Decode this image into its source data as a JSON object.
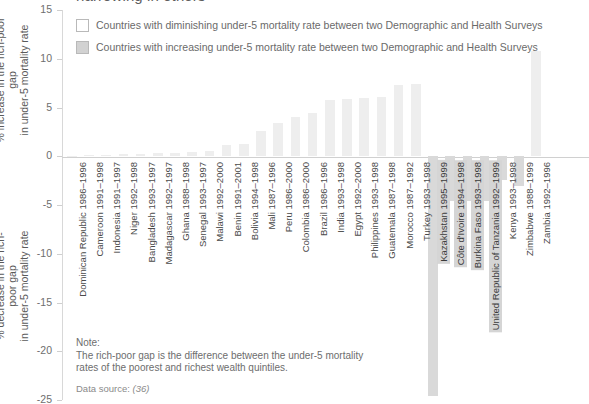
{
  "chart": {
    "title": "narrowing in others",
    "legend": [
      {
        "key": "diminishing",
        "label": "Countries with diminishing under-5 mortality rate between two Demographic and Health Surveys",
        "swatch": "#ffffff"
      },
      {
        "key": "increasing",
        "label": "Countries with increasing under-5 mortality rate between two Demographic and Health Surveys",
        "swatch": "#d2d2d2"
      }
    ],
    "axis_title_up": "% increase in the rich-poor gap\nin under-5 mortality rate",
    "axis_title_down": "% decrease in the rich-poor gap\nin under-5 mortality rate",
    "note_heading": "Note:",
    "note_body": "The rich-poor gap is the difference between the under-5 mortality\nrates of the poorest and richest wealth quintiles.",
    "source_prefix": "Data source: ",
    "source_ref": "(36)"
  },
  "chart_data": {
    "type": "bar",
    "title": "narrowing in others",
    "xlabel": "",
    "ylabel": "% increase / % decrease in the rich-poor gap in under-5 mortality rate",
    "ylim": [
      -25,
      15
    ],
    "yticks": [
      15,
      10,
      5,
      0,
      -5,
      -10,
      -15,
      -20,
      -25
    ],
    "grid": false,
    "legend_position": "top-left",
    "colors": {
      "diminishing": "#eeeeee",
      "increasing": "#d9d9d9",
      "axis": "#d0d0d0",
      "text": "#4a4a4a"
    },
    "categories": [
      "Dominican Republic 1986–1996",
      "Cameroon 1991–1998",
      "Indonesia 1991–1997",
      "Niger 1992–1998",
      "Bangladesh 1993–1997",
      "Madagascar 1992–1997",
      "Ghana 1988–1998",
      "Senegal 1993–1997",
      "Malawi 1992–2000",
      "Benin 1991–2001",
      "Bolivia 1994–1998",
      "Mali 1987–1996",
      "Peru 1986–2000",
      "Colombia 1986–2000",
      "Brazil 1986–1996",
      "India 1993–1998",
      "Egypt 1992–2000",
      "Philippines 1993–1998",
      "Guatemala 1987–1998",
      "Morocco 1987–1992",
      "Turkey 1993–1998",
      "Kazakhstan 1995–1999",
      "Côte d'Ivoire 1994–1998",
      "Burkina Faso 1993–1998",
      "United Republic of Tanzania 1992–1999",
      "Kenya 1993–1998",
      "Zimbabwe 1988–1999",
      "Zambia 1992–1996"
    ],
    "values": [
      0.05,
      0.1,
      0.15,
      0.2,
      0.25,
      0.3,
      0.35,
      0.4,
      0.5,
      1.2,
      1.3,
      2.6,
      3.4,
      4.0,
      4.4,
      5.8,
      5.9,
      6.0,
      6.1,
      7.3,
      7.4,
      -24.6,
      -4.6,
      -4.6,
      -4.6,
      -2.4,
      -3.0,
      10.8
    ],
    "groups": [
      "diminishing",
      "diminishing",
      "diminishing",
      "diminishing",
      "diminishing",
      "diminishing",
      "diminishing",
      "diminishing",
      "diminishing",
      "diminishing",
      "diminishing",
      "diminishing",
      "diminishing",
      "diminishing",
      "diminishing",
      "diminishing",
      "diminishing",
      "diminishing",
      "diminishing",
      "diminishing",
      "diminishing",
      "increasing",
      "increasing",
      "increasing",
      "increasing",
      "increasing",
      "increasing",
      "increasing"
    ],
    "highlighted_labels": [
      "Kazakhstan 1995–1999",
      "Côte d'Ivoire 1994–1998",
      "Burkina Faso 1993–1998",
      "United Republic of Tanzania 1992–1999"
    ]
  }
}
